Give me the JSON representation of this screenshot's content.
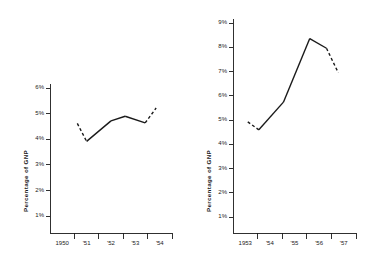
{
  "figure": {
    "background": "#ffffff",
    "ink": "#1a1a1a"
  },
  "chart_data": [
    {
      "id": "left",
      "type": "line",
      "title": "",
      "xlabel": "",
      "ylabel": "Percentage of GNP",
      "x": [
        "1950",
        "'51",
        "'52",
        "'53",
        "'54"
      ],
      "xtick_labels": [
        "1950",
        "'51",
        "'52",
        "'53",
        "'54"
      ],
      "ytick_labels": [
        "6%",
        "5%",
        "4%",
        "3%",
        "2%",
        "1%"
      ],
      "ylim": [
        0,
        6.6
      ],
      "yticks": [
        1,
        2,
        3,
        4,
        5,
        6
      ],
      "grid": false,
      "legend": "none",
      "series": [
        {
          "name": "Percentage of GNP",
          "points": [
            {
              "x": 0.62,
              "y": 4.62,
              "style": "dashed"
            },
            {
              "x": 1.0,
              "y": 3.92,
              "style": "solid"
            },
            {
              "x": 2.0,
              "y": 4.72,
              "style": "solid"
            },
            {
              "x": 2.58,
              "y": 4.9,
              "style": "solid"
            },
            {
              "x": 3.4,
              "y": 4.64,
              "style": "dashed"
            },
            {
              "x": 3.85,
              "y": 5.22,
              "style": "dashed"
            }
          ],
          "dashed_segments": [
            "start",
            "end"
          ]
        }
      ]
    },
    {
      "id": "right",
      "type": "line",
      "title": "",
      "xlabel": "",
      "ylabel": "Percentage of GNP",
      "x": [
        "1953",
        "'54",
        "'55",
        "'56",
        "'57"
      ],
      "xtick_labels": [
        "1953",
        "'54",
        "'55",
        "'56",
        "'57"
      ],
      "ytick_labels": [
        "9%",
        "8%",
        "7%",
        "6%",
        "5%",
        "4%",
        "3%",
        "2%",
        "1%"
      ],
      "ylim": [
        0,
        9.6
      ],
      "yticks": [
        1,
        2,
        3,
        4,
        5,
        6,
        7,
        8,
        9
      ],
      "grid": false,
      "legend": "none",
      "series": [
        {
          "name": "Percentage of GNP",
          "points": [
            {
              "x": 0.1,
              "y": 4.93,
              "style": "dashed"
            },
            {
              "x": 0.55,
              "y": 4.6,
              "style": "solid"
            },
            {
              "x": 1.55,
              "y": 5.74,
              "style": "solid"
            },
            {
              "x": 2.62,
              "y": 8.36,
              "style": "solid"
            },
            {
              "x": 3.3,
              "y": 7.96,
              "style": "solid"
            },
            {
              "x": 3.78,
              "y": 6.95,
              "style": "dashed"
            }
          ],
          "dashed_segments": [
            "start",
            "end"
          ]
        }
      ]
    }
  ]
}
